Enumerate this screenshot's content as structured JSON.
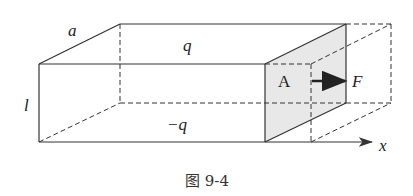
{
  "diagram": {
    "labels": {
      "a": "a",
      "q_top": "q",
      "l": "l",
      "q_bottom": "−q",
      "area": "A",
      "force": "F",
      "axis": "x"
    },
    "caption": "图 9-4",
    "colors": {
      "line": "#333333",
      "shaded_face": "#e6e6e6"
    }
  }
}
